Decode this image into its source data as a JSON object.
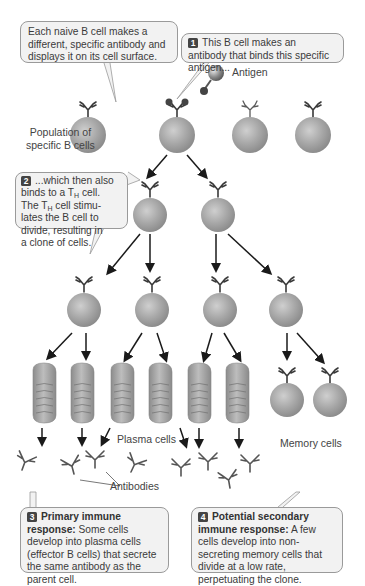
{
  "callouts": {
    "naive": {
      "text": "Each naive B cell makes a different, specific antibody and displays it on its cell surface."
    },
    "step1": {
      "number": "1",
      "text": "This B cell makes an antibody that binds this specific antigen..."
    },
    "step2": {
      "number": "2",
      "line1": "...which then also",
      "line2a": "binds to a T",
      "line2sub": "H",
      "line2b": " cell.",
      "line3a": "The T",
      "line3sub": "H",
      "line3b": " cell stimu-",
      "line4": "lates the B cell to",
      "line5": "divide, resulting in",
      "line6": "a clone of cells."
    },
    "step3": {
      "number": "3",
      "title": "Primary immune response:",
      "text": "Some cells develop into plasma cells (effector B cells) that secrete the same antibody as the parent cell."
    },
    "step4": {
      "number": "4",
      "title": "Potential secondary immune response:",
      "text": "A few cells develop into non-secreting memory cells that divide at a low rate, perpetuating the clone."
    }
  },
  "labels": {
    "antigen": "Antigen",
    "population_line1": "Population of",
    "population_line2": "specific B cells",
    "plasma_cells": "Plasma cells",
    "memory_cells": "Memory cells",
    "antibodies": "Antibodies"
  },
  "colors": {
    "cell_fill": "#a9a9a9",
    "callout_bg": "#f2f2f2",
    "badge": "#444444",
    "arrow": "#1a1a1a"
  }
}
